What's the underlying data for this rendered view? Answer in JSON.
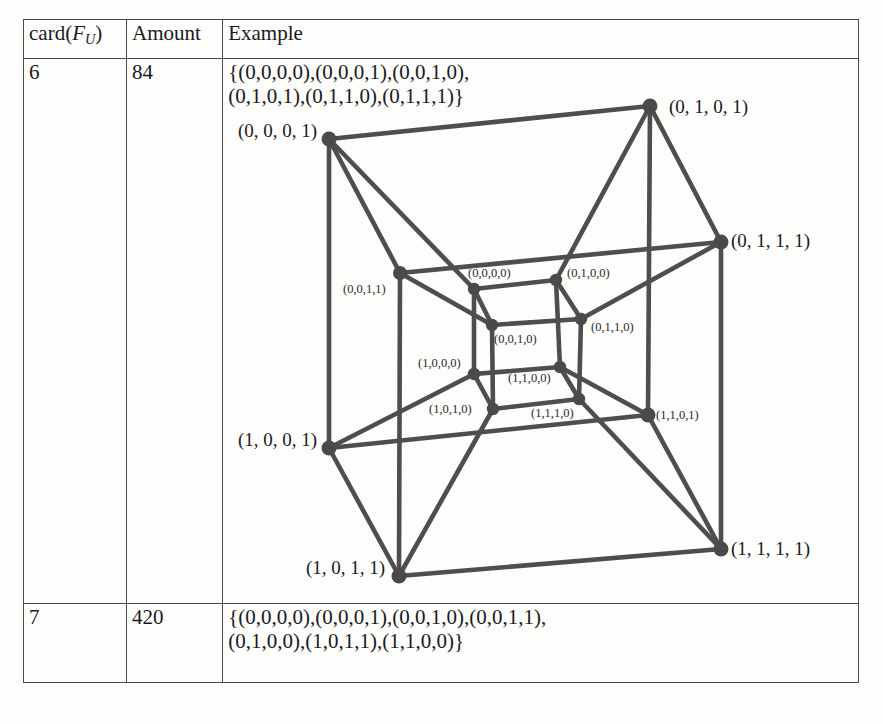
{
  "table": {
    "headers": {
      "col1_prefix": "card(",
      "col1_var": "F",
      "col1_sub": "U",
      "col1_suffix": ")",
      "col2": "Amount",
      "col3": "Example"
    },
    "rows": [
      {
        "card": "6",
        "amount": "84",
        "example": "{(0,0,0,0),(0,0,0,1),(0,0,1,0),\n(0,1,0,1),(0,1,1,0),(0,1,1,1)}"
      },
      {
        "card": "7",
        "amount": "420",
        "example": "{(0,0,0,0),(0,0,0,1),(0,0,1,0),(0,0,1,1),\n(0,1,0,0),(1,0,1,1),(1,1,0,0)}"
      }
    ]
  },
  "colors": {
    "edge": "#4e4e4e",
    "vertex": "#4a4a4a",
    "border": "#4a4a4a",
    "text": "#1a1a1a",
    "background": "#fdfdfc"
  },
  "diagram": {
    "type": "tesseract-graph",
    "vertex_count": 16,
    "edge_count": 32,
    "outer_labels_spaced": true,
    "vertices": [
      {
        "id": "0001",
        "label": "(0, 0, 0, 1)",
        "x": 331,
        "y": 170,
        "r": 7.5,
        "group": "outer",
        "label_x": 240,
        "label_y": 168,
        "label_anchor": "start",
        "label_class": "lbl-out"
      },
      {
        "id": "0101",
        "label": "(0, 1, 0, 1)",
        "x": 652,
        "y": 137,
        "r": 7.5,
        "group": "outer",
        "label_x": 671,
        "label_y": 144,
        "label_anchor": "start",
        "label_class": "lbl-out"
      },
      {
        "id": "0111",
        "label": "(0, 1, 1, 1)",
        "x": 723,
        "y": 273,
        "r": 7.5,
        "group": "outer",
        "label_x": 733,
        "label_y": 278,
        "label_anchor": "start",
        "label_class": "lbl-out"
      },
      {
        "id": "1001",
        "label": "(1, 0, 0, 1)",
        "x": 331,
        "y": 479,
        "r": 7.5,
        "group": "outer",
        "label_x": 240,
        "label_y": 477,
        "label_anchor": "start",
        "label_class": "lbl-out"
      },
      {
        "id": "1101",
        "label": "(1, 1, 0, 1)",
        "x": 650,
        "y": 446,
        "r": 7.5,
        "group": "outer",
        "label_x": 658,
        "label_y": 450,
        "label_anchor": "start",
        "label_class": "lbl-in"
      },
      {
        "id": "1011",
        "label": "(1, 0, 1, 1)",
        "x": 401,
        "y": 607,
        "r": 7.5,
        "group": "outer",
        "label_x": 308,
        "label_y": 605,
        "label_anchor": "start",
        "label_class": "lbl-out"
      },
      {
        "id": "1111",
        "label": "(1, 1, 1, 1)",
        "x": 723,
        "y": 580,
        "r": 7.5,
        "group": "outer",
        "label_x": 733,
        "label_y": 586,
        "label_anchor": "start",
        "label_class": "lbl-out"
      },
      {
        "id": "0011",
        "label": "(0, 0, 1, 1)",
        "x": 402,
        "y": 304,
        "r": 7.0,
        "group": "outer",
        "label_x": 345,
        "label_y": 324,
        "label_anchor": "start",
        "label_class": "lbl-in"
      },
      {
        "id": "0000",
        "label": "(0, 0, 0, 0)",
        "x": 476,
        "y": 320,
        "r": 6.2,
        "group": "inner",
        "label_x": 470,
        "label_y": 308,
        "label_anchor": "start",
        "label_class": "lbl-in"
      },
      {
        "id": "0100",
        "label": "(0, 1, 0, 0)",
        "x": 558,
        "y": 311,
        "r": 6.2,
        "group": "inner",
        "label_x": 569,
        "label_y": 308,
        "label_anchor": "start",
        "label_class": "lbl-in"
      },
      {
        "id": "0110",
        "label": "(0, 1, 1, 0)",
        "x": 583,
        "y": 350,
        "r": 6.2,
        "group": "inner",
        "label_x": 593,
        "label_y": 362,
        "label_anchor": "start",
        "label_class": "lbl-in"
      },
      {
        "id": "0010",
        "label": "(0, 0, 1, 0)",
        "x": 494,
        "y": 356,
        "r": 6.2,
        "group": "inner",
        "label_x": 496,
        "label_y": 374,
        "label_anchor": "start",
        "label_class": "lbl-in"
      },
      {
        "id": "1000",
        "label": "(1, 0, 0, 0)",
        "x": 476,
        "y": 405,
        "r": 6.2,
        "group": "inner",
        "label_x": 420,
        "label_y": 398,
        "label_anchor": "start",
        "label_class": "lbl-in"
      },
      {
        "id": "1100",
        "label": "(1, 1, 0, 0)",
        "x": 562,
        "y": 398,
        "r": 6.2,
        "group": "inner",
        "label_x": 510,
        "label_y": 413,
        "label_anchor": "start",
        "label_class": "lbl-in"
      },
      {
        "id": "1110",
        "label": "(1, 1, 1, 0)",
        "x": 581,
        "y": 430,
        "r": 6.2,
        "group": "inner",
        "label_x": 533,
        "label_y": 448,
        "label_anchor": "start",
        "label_class": "lbl-in"
      },
      {
        "id": "1010",
        "label": "(1, 0, 1, 0)",
        "x": 495,
        "y": 440,
        "r": 6.2,
        "group": "inner",
        "label_x": 431,
        "label_y": 444,
        "label_anchor": "start",
        "label_class": "lbl-in"
      }
    ],
    "edges": [
      [
        "0001",
        "0101"
      ],
      [
        "0001",
        "0011"
      ],
      [
        "0001",
        "1001"
      ],
      [
        "0001",
        "0000"
      ],
      [
        "0101",
        "0111"
      ],
      [
        "0101",
        "1101"
      ],
      [
        "0101",
        "0100"
      ],
      [
        "0111",
        "0011"
      ],
      [
        "0111",
        "1111"
      ],
      [
        "0111",
        "0110"
      ],
      [
        "0011",
        "1011"
      ],
      [
        "0011",
        "0010"
      ],
      [
        "1001",
        "1101"
      ],
      [
        "1001",
        "1011"
      ],
      [
        "1001",
        "1000"
      ],
      [
        "1101",
        "1111"
      ],
      [
        "1101",
        "1100"
      ],
      [
        "1011",
        "1111"
      ],
      [
        "1011",
        "1010"
      ],
      [
        "1111",
        "1110"
      ],
      [
        "0000",
        "0100"
      ],
      [
        "0000",
        "0010"
      ],
      [
        "0000",
        "1000"
      ],
      [
        "0100",
        "0110"
      ],
      [
        "0100",
        "1100"
      ],
      [
        "0110",
        "0010"
      ],
      [
        "0110",
        "1110"
      ],
      [
        "0010",
        "1010"
      ],
      [
        "1000",
        "1100"
      ],
      [
        "1000",
        "1010"
      ],
      [
        "1100",
        "1110"
      ],
      [
        "1110",
        "1010"
      ]
    ]
  }
}
